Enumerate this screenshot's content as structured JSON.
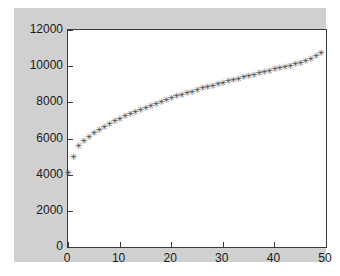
{
  "figure": {
    "background_color": "#d0d0d0",
    "axes_background_color": "#ffffff",
    "axes_line_color": "#3a3a3a",
    "marker_color": "#404040",
    "marker_glyph": "✳"
  },
  "chart_data": {
    "type": "scatter",
    "title": "",
    "xlabel": "",
    "ylabel": "",
    "xlim": [
      0,
      50
    ],
    "ylim": [
      0,
      12000
    ],
    "grid": false,
    "legend": null,
    "marker": "+",
    "xticks": [
      0,
      10,
      20,
      30,
      40,
      50
    ],
    "xtick_labels": [
      "0",
      "10",
      "20",
      "30",
      "40",
      "50"
    ],
    "yticks": [
      0,
      2000,
      4000,
      6000,
      8000,
      10000,
      12000
    ],
    "ytick_labels": [
      "0",
      "2000",
      "4000",
      "6000",
      "8000",
      "10000",
      "12000"
    ],
    "series": [
      {
        "name": "data",
        "x": [
          0,
          1,
          2,
          3,
          4,
          5,
          6,
          7,
          8,
          9,
          10,
          11,
          12,
          13,
          14,
          15,
          16,
          17,
          18,
          19,
          20,
          21,
          22,
          23,
          24,
          25,
          26,
          27,
          28,
          29,
          30,
          31,
          32,
          33,
          34,
          35,
          36,
          37,
          38,
          39,
          40,
          41,
          42,
          43,
          44,
          45,
          46,
          47,
          48,
          49
        ],
        "y": [
          4050,
          4950,
          5530,
          5850,
          6080,
          6280,
          6450,
          6620,
          6780,
          6930,
          7070,
          7200,
          7320,
          7440,
          7560,
          7680,
          7790,
          7900,
          8000,
          8100,
          8200,
          8300,
          8390,
          8480,
          8570,
          8660,
          8740,
          8820,
          8900,
          8980,
          9060,
          9140,
          9210,
          9290,
          9360,
          9430,
          9510,
          9580,
          9650,
          9720,
          9790,
          9860,
          9930,
          10000,
          10070,
          10150,
          10250,
          10380,
          10530,
          10700
        ]
      }
    ]
  }
}
